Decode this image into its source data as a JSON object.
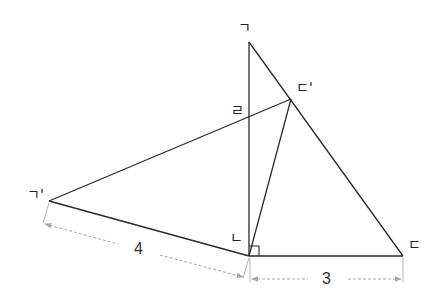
{
  "diagram": {
    "type": "geometry-rotation",
    "colors": {
      "line": "#2a2a2a",
      "dimension": "#a8a8a8",
      "text": "#222222"
    },
    "points": {
      "A": {
        "label": "ㄱ",
        "x": 249,
        "y": 42
      },
      "B": {
        "label": "ㄴ",
        "x": 249,
        "y": 256
      },
      "C": {
        "label": "ㄷ",
        "x": 403,
        "y": 256
      },
      "A2": {
        "label": "ㄱ'",
        "x": 49,
        "y": 201
      },
      "C2": {
        "label": "ㄷ'",
        "x": 291,
        "y": 99
      },
      "D": {
        "label": "ㄹ",
        "x": 249,
        "y": 111
      }
    },
    "labels": {
      "A": "ㄱ",
      "A_prime": "ㄱ'",
      "B": "ㄴ",
      "C": "ㄷ",
      "C_prime": "ㄷ'",
      "D": "ㄹ"
    },
    "dimensions": {
      "A_prime_B": "4",
      "B_C": "3"
    },
    "right_angle_at": "ㄴ"
  }
}
